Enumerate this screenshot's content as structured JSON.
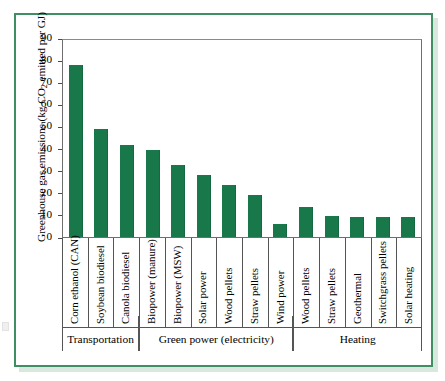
{
  "chart_data": {
    "type": "bar",
    "title": "",
    "xlabel": "",
    "ylabel": "Greenhouse gas emissions (kg CO2 emitted per GJ)",
    "ylabel_parts": {
      "before": "Greenhouse gas emissions (kg CO",
      "subscript": "2",
      "after": " emitted per GJ)"
    },
    "ylim": [
      0,
      90
    ],
    "ytick_labels": [
      "90",
      "80",
      "70",
      "60",
      "50",
      "40",
      "30",
      "20",
      "10",
      "0"
    ],
    "ytick_values": [
      90,
      80,
      70,
      60,
      50,
      40,
      30,
      20,
      10,
      0
    ],
    "grid": false,
    "legend": "none",
    "categories": [
      "Corn ethanol (CAN)",
      "Soybean biodiesel",
      "Canola biodiesel",
      "Biopower (manure)",
      "Biopower (MSW)",
      "Solar power",
      "Wood pellets",
      "Straw pellets",
      "Wind power",
      "Wood pellets",
      "Straw pellets",
      "Geothermal",
      "Switchgrass pellets",
      "Solar heating"
    ],
    "values": [
      78,
      49,
      41.5,
      39.5,
      32.5,
      28,
      23.5,
      19,
      6,
      13.5,
      9.5,
      9,
      9,
      9
    ],
    "bar_color": "#18784a",
    "groups": [
      {
        "label": "Transportation",
        "count": 3
      },
      {
        "label": "Green power (electricity)",
        "count": 6
      },
      {
        "label": "Heating",
        "count": 5
      }
    ]
  },
  "figure": {
    "frame_color": "#3f8f63"
  }
}
